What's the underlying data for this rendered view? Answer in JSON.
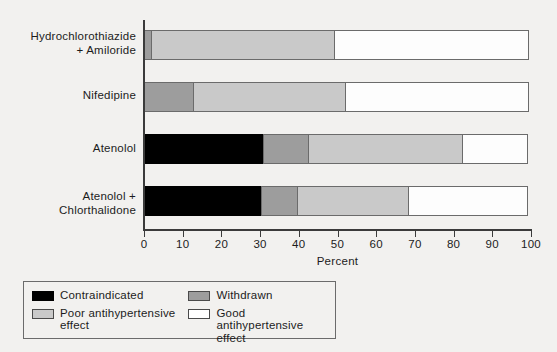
{
  "chart_data": {
    "type": "bar",
    "orientation": "horizontal",
    "stacked": true,
    "title": "",
    "xlabel": "Percent",
    "ylabel": "",
    "xlim": [
      0,
      100
    ],
    "xticks": [
      0,
      10,
      20,
      30,
      40,
      50,
      60,
      70,
      80,
      90,
      100
    ],
    "grid": false,
    "legend_position": "bottom-left",
    "categories": [
      "Hydrochlorothiazide + Amiloride",
      "Nifedipine",
      "Atenolol",
      "Atenolol + Chlorthalidone"
    ],
    "category_labels": [
      {
        "line1": "Hydrochlorothiazide",
        "line2": "+ Amiloride"
      },
      {
        "line1": "Nifedipine",
        "line2": ""
      },
      {
        "line1": "Atenolol",
        "line2": ""
      },
      {
        "line1": "Atenolol +",
        "line2": "Chlorthalidone"
      }
    ],
    "series": [
      {
        "name": "Contraindicated",
        "color": "#000000",
        "values": [
          0,
          0,
          31,
          30.5
        ]
      },
      {
        "name": "Withdrawn",
        "color": "#9d9d9d",
        "values": [
          2,
          13,
          12,
          9.5
        ]
      },
      {
        "name": "Poor antihypertensive effect",
        "color": "#c9c9c9",
        "values": [
          47.5,
          39.5,
          40,
          29
        ]
      },
      {
        "name": "Good antihypertensive effect",
        "color": "#ffffff",
        "values": [
          50.5,
          47.5,
          17,
          31
        ]
      }
    ],
    "legend": [
      {
        "label": "Contraindicated",
        "color": "#000000"
      },
      {
        "label": "Withdrawn",
        "color": "#9d9d9d"
      },
      {
        "label": "Poor antihypertensive effect",
        "color": "#c9c9c9"
      },
      {
        "label": "Good antihypertensive effect",
        "color": "#ffffff"
      }
    ],
    "legend_labels": {
      "contraindicated": "Contraindicated",
      "withdrawn": "Withdrawn",
      "poor_line1": "Poor antihypertensive",
      "poor_line2": "effect",
      "good_line1": "Good antihypertensive",
      "good_line2": "effect"
    }
  }
}
